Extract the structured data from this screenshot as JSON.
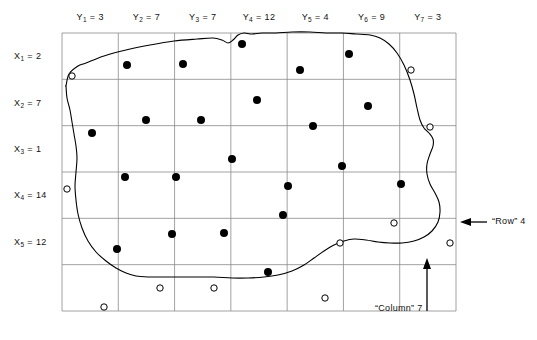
{
  "figure": {
    "title": "",
    "grid": {
      "left": 62,
      "top": 33,
      "right": 456,
      "bottom": 311,
      "cols": 7,
      "rows": 6,
      "line_color": "#8a8a8a"
    },
    "column_headers": [
      {
        "symbol": "Y",
        "index": "1",
        "eq": "=",
        "value": "3"
      },
      {
        "symbol": "Y",
        "index": "2",
        "eq": "=",
        "value": "7"
      },
      {
        "symbol": "Y",
        "index": "3",
        "eq": "=",
        "value": "7"
      },
      {
        "symbol": "Y",
        "index": "4",
        "eq": "=",
        "value": "12"
      },
      {
        "symbol": "Y",
        "index": "5",
        "eq": "=",
        "value": "4"
      },
      {
        "symbol": "Y",
        "index": "6",
        "eq": "=",
        "value": "9"
      },
      {
        "symbol": "Y",
        "index": "7",
        "eq": "=",
        "value": "3"
      }
    ],
    "row_headers": [
      {
        "symbol": "X",
        "index": "1",
        "eq": "=",
        "value": "2"
      },
      {
        "symbol": "X",
        "index": "2",
        "eq": "=",
        "value": "7"
      },
      {
        "symbol": "X",
        "index": "3",
        "eq": "=",
        "value": "1"
      },
      {
        "symbol": "X",
        "index": "4",
        "eq": "=",
        "value": "14"
      },
      {
        "symbol": "X",
        "index": "5",
        "eq": "=",
        "value": "12"
      }
    ],
    "annotations": [
      {
        "id": "row-annotation",
        "text": "“Row” 4",
        "arrow": "left"
      },
      {
        "id": "column-annotation",
        "text": "“Column” 7",
        "arrow": "up"
      }
    ],
    "legend_note": ""
  },
  "chart_data": {
    "type": "scatter",
    "title": "",
    "xlabel": "",
    "ylabel": "",
    "grid": true,
    "legend_position": "none",
    "axis_ranges": {
      "x": [
        0,
        7
      ],
      "y": [
        0,
        6
      ]
    },
    "column_values": [
      3,
      7,
      7,
      12,
      4,
      9,
      3
    ],
    "row_values": [
      2,
      7,
      1,
      14,
      12
    ],
    "column_labels": [
      "Y1 = 3",
      "Y2 = 7",
      "Y3 = 7",
      "Y4 = 12",
      "Y5 = 4",
      "Y6 = 9",
      "Y7 = 3"
    ],
    "row_labels": [
      "X1 = 2",
      "X2 = 7",
      "X3 = 1",
      "X4 = 14",
      "X5 = 12"
    ],
    "series": [
      {
        "name": "inside-points",
        "marker": "filled-circle",
        "color": "#000000",
        "points": [
          [
            127,
            65
          ],
          [
            183,
            64
          ],
          [
            242,
            44
          ],
          [
            349,
            54
          ],
          [
            300,
            70
          ],
          [
            92,
            133
          ],
          [
            146,
            120
          ],
          [
            201,
            120
          ],
          [
            257,
            100
          ],
          [
            313,
            126
          ],
          [
            368,
            106
          ],
          [
            125,
            177
          ],
          [
            176,
            177
          ],
          [
            232,
            159
          ],
          [
            342,
            166
          ],
          [
            288,
            186
          ],
          [
            401,
            184
          ],
          [
            283,
            215
          ],
          [
            172,
            234
          ],
          [
            224,
            233
          ],
          [
            117,
            249
          ],
          [
            268,
            272
          ]
        ]
      },
      {
        "name": "outside-points",
        "marker": "open-circle",
        "color": "#000000",
        "points": [
          [
            72,
            76
          ],
          [
            411,
            70
          ],
          [
            430,
            127
          ],
          [
            67,
            189
          ],
          [
            394,
            223
          ],
          [
            340,
            243
          ],
          [
            450,
            243
          ],
          [
            160,
            288
          ],
          [
            214,
            288
          ],
          [
            325,
            298
          ],
          [
            104,
            307
          ]
        ]
      }
    ],
    "boundary": {
      "name": "region-outline",
      "closed": true,
      "color": "#000000",
      "points": [
        [
          66,
          86
        ],
        [
          69,
          74
        ],
        [
          78,
          66
        ],
        [
          86,
          63
        ],
        [
          104,
          56
        ],
        [
          126,
          50
        ],
        [
          150,
          45
        ],
        [
          174,
          41
        ],
        [
          197,
          39
        ],
        [
          213,
          38
        ],
        [
          222,
          40
        ],
        [
          228,
          43
        ],
        [
          233,
          40
        ],
        [
          238,
          35
        ],
        [
          244,
          33
        ],
        [
          252,
          34
        ],
        [
          262,
          33
        ],
        [
          276,
          33
        ],
        [
          292,
          32
        ],
        [
          310,
          32
        ],
        [
          326,
          33
        ],
        [
          342,
          33
        ],
        [
          356,
          34
        ],
        [
          370,
          35
        ],
        [
          380,
          38
        ],
        [
          389,
          44
        ],
        [
          397,
          53
        ],
        [
          404,
          65
        ],
        [
          410,
          80
        ],
        [
          414,
          94
        ],
        [
          417,
          108
        ],
        [
          420,
          120
        ],
        [
          424,
          128
        ],
        [
          429,
          133
        ],
        [
          433,
          139
        ],
        [
          433,
          146
        ],
        [
          430,
          154
        ],
        [
          427,
          164
        ],
        [
          427,
          174
        ],
        [
          430,
          184
        ],
        [
          435,
          193
        ],
        [
          439,
          202
        ],
        [
          440,
          212
        ],
        [
          438,
          222
        ],
        [
          432,
          231
        ],
        [
          424,
          237
        ],
        [
          414,
          241
        ],
        [
          402,
          243
        ],
        [
          390,
          243
        ],
        [
          378,
          242
        ],
        [
          366,
          240
        ],
        [
          354,
          239
        ],
        [
          344,
          241
        ],
        [
          334,
          245
        ],
        [
          324,
          251
        ],
        [
          314,
          258
        ],
        [
          304,
          265
        ],
        [
          292,
          271
        ],
        [
          278,
          275
        ],
        [
          264,
          277
        ],
        [
          248,
          278
        ],
        [
          232,
          278
        ],
        [
          214,
          277
        ],
        [
          196,
          277
        ],
        [
          178,
          277
        ],
        [
          162,
          277
        ],
        [
          148,
          277
        ],
        [
          136,
          276
        ],
        [
          126,
          273
        ],
        [
          116,
          268
        ],
        [
          106,
          261
        ],
        [
          96,
          252
        ],
        [
          88,
          241
        ],
        [
          82,
          228
        ],
        [
          78,
          214
        ],
        [
          76,
          200
        ],
        [
          75,
          186
        ],
        [
          76,
          172
        ],
        [
          77,
          158
        ],
        [
          76,
          146
        ],
        [
          74,
          134
        ],
        [
          72,
          122
        ],
        [
          70,
          110
        ],
        [
          67,
          98
        ],
        [
          66,
          86
        ]
      ]
    }
  }
}
